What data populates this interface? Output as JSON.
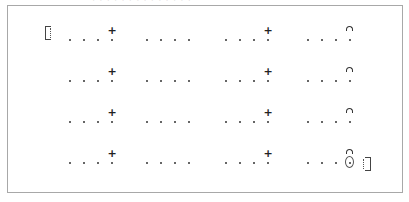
{
  "caption": {
    "text": "· · · · · · · · · · · · · ·"
  },
  "matrix": {
    "rows": 4,
    "columns": 4,
    "dots_per_cell": 4,
    "open_bracket": "[⁝",
    "close_bracket": "⁝]",
    "cells": [
      [
        {
          "accent": "+",
          "accent_type": "plus"
        },
        {
          "accent": "",
          "accent_type": "none"
        },
        {
          "accent": "+",
          "accent_type": "plus"
        },
        {
          "accent": "⌒",
          "accent_type": "arc"
        }
      ],
      [
        {
          "accent": "+",
          "accent_type": "plus"
        },
        {
          "accent": "",
          "accent_type": "none"
        },
        {
          "accent": "+",
          "accent_type": "plus"
        },
        {
          "accent": "⌒",
          "accent_type": "arc"
        }
      ],
      [
        {
          "accent": "+",
          "accent_type": "plus"
        },
        {
          "accent": "",
          "accent_type": "none"
        },
        {
          "accent": "+",
          "accent_type": "plus"
        },
        {
          "accent": "⌒",
          "accent_type": "arc"
        }
      ],
      [
        {
          "accent": "+",
          "accent_type": "plus"
        },
        {
          "accent": "",
          "accent_type": "none"
        },
        {
          "accent": "+",
          "accent_type": "plus"
        },
        {
          "accent": "⌒",
          "accent_type": "arc-circled"
        }
      ]
    ]
  },
  "colors": {
    "border": "#a8a8a8",
    "ink": "#333333",
    "background": "#ffffff"
  }
}
